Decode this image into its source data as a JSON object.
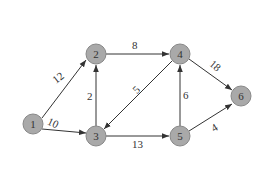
{
  "diagram": {
    "type": "directed-weighted-graph",
    "nodes": [
      {
        "id": "1",
        "label": "1",
        "x": 33,
        "y": 124
      },
      {
        "id": "2",
        "label": "2",
        "x": 96,
        "y": 54
      },
      {
        "id": "3",
        "label": "3",
        "x": 96,
        "y": 136
      },
      {
        "id": "4",
        "label": "4",
        "x": 180,
        "y": 54
      },
      {
        "id": "5",
        "label": "5",
        "x": 180,
        "y": 136
      },
      {
        "id": "6",
        "label": "6",
        "x": 241,
        "y": 96
      }
    ],
    "edges": [
      {
        "from": "1",
        "to": "2",
        "weight": "12"
      },
      {
        "from": "1",
        "to": "3",
        "weight": "10"
      },
      {
        "from": "3",
        "to": "2",
        "weight": "2"
      },
      {
        "from": "2",
        "to": "4",
        "weight": "8"
      },
      {
        "from": "4",
        "to": "3",
        "weight": "5"
      },
      {
        "from": "3",
        "to": "5",
        "weight": "13"
      },
      {
        "from": "5",
        "to": "4",
        "weight": "6"
      },
      {
        "from": "4",
        "to": "6",
        "weight": "18"
      },
      {
        "from": "5",
        "to": "6",
        "weight": "4"
      }
    ]
  },
  "colors": {
    "node_fill": "#a9a9a9",
    "node_stroke": "#888888",
    "edge": "#333333"
  }
}
